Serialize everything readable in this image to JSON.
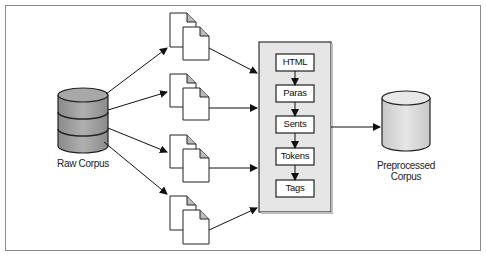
{
  "diagram": {
    "source": {
      "label": "Raw Corpus",
      "icon": "database-icon",
      "color": "#9a9a9a"
    },
    "documents": [
      {
        "name": "document-group-1"
      },
      {
        "name": "document-group-2"
      },
      {
        "name": "document-group-3"
      },
      {
        "name": "document-group-4"
      }
    ],
    "pipeline": {
      "background": "#e4e4e4",
      "steps": [
        {
          "label": "HTML"
        },
        {
          "label": "Paras"
        },
        {
          "label": "Sents"
        },
        {
          "label": "Tokens"
        },
        {
          "label": "Tags"
        }
      ]
    },
    "output": {
      "label_line1": "Preprocessed",
      "label_line2": "Corpus",
      "icon": "database-icon",
      "color": "#d4d4d4"
    }
  }
}
